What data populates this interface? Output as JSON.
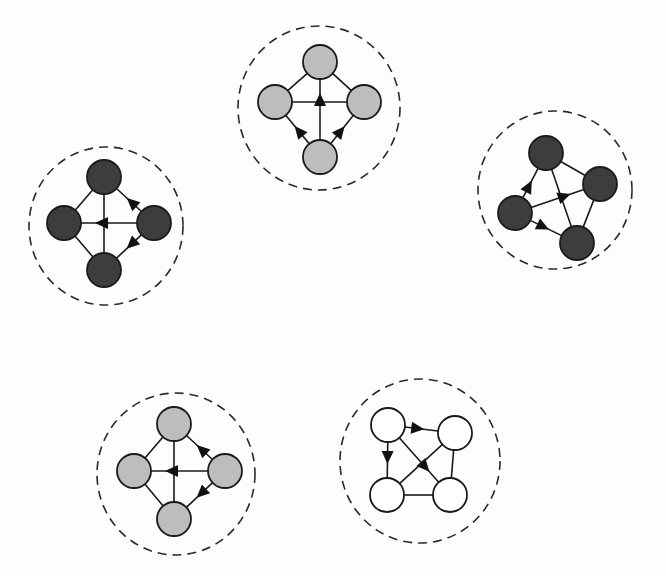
{
  "diagram": {
    "colors": {
      "background": "#fdfdfb",
      "light_gray": "#bdbdbd",
      "dark_gray": "#3d3d3d",
      "white": "#ffffff",
      "stroke": "#1a1a1a"
    },
    "clusters": [
      {
        "id": "top",
        "fill": "#bdbdbd",
        "nodes": [
          "top",
          "left",
          "right",
          "bottom"
        ],
        "edges": [
          {
            "from": "top",
            "to": "left",
            "directed": false
          },
          {
            "from": "top",
            "to": "right",
            "directed": false
          },
          {
            "from": "left",
            "to": "right",
            "directed": false
          },
          {
            "from": "bottom",
            "to": "top",
            "directed": true
          },
          {
            "from": "bottom",
            "to": "left",
            "directed": true
          },
          {
            "from": "bottom",
            "to": "right",
            "directed": true
          }
        ]
      },
      {
        "id": "left",
        "fill": "#3d3d3d",
        "nodes": [
          "top",
          "left",
          "right",
          "bottom"
        ],
        "edges": [
          {
            "from": "top",
            "to": "left",
            "directed": false
          },
          {
            "from": "left",
            "to": "bottom",
            "directed": false
          },
          {
            "from": "top",
            "to": "bottom",
            "directed": false
          },
          {
            "from": "right",
            "to": "left",
            "directed": true
          },
          {
            "from": "right",
            "to": "top",
            "directed": true
          },
          {
            "from": "right",
            "to": "bottom",
            "directed": true
          }
        ]
      },
      {
        "id": "right",
        "fill": "#3d3d3d",
        "nodes": [
          "top",
          "right",
          "left",
          "bottom"
        ],
        "edges": [
          {
            "from": "top",
            "to": "right",
            "directed": false
          },
          {
            "from": "top",
            "to": "bottom",
            "directed": false
          },
          {
            "from": "right",
            "to": "bottom",
            "directed": false
          },
          {
            "from": "left",
            "to": "top",
            "directed": true
          },
          {
            "from": "left",
            "to": "right",
            "directed": true
          },
          {
            "from": "left",
            "to": "bottom",
            "directed": true
          }
        ]
      },
      {
        "id": "bottom-left",
        "fill": "#bdbdbd",
        "nodes": [
          "top",
          "left",
          "right",
          "bottom"
        ],
        "edges": [
          {
            "from": "top",
            "to": "left",
            "directed": false
          },
          {
            "from": "left",
            "to": "bottom",
            "directed": false
          },
          {
            "from": "top",
            "to": "bottom",
            "directed": false
          },
          {
            "from": "right",
            "to": "left",
            "directed": true
          },
          {
            "from": "right",
            "to": "top",
            "directed": true
          },
          {
            "from": "right",
            "to": "bottom",
            "directed": true
          }
        ]
      },
      {
        "id": "bottom-right",
        "fill": "#ffffff",
        "nodes": [
          "tl",
          "tr",
          "bl",
          "br"
        ],
        "edges": [
          {
            "from": "tl",
            "to": "tr",
            "directed": true
          },
          {
            "from": "tl",
            "to": "bl",
            "directed": true
          },
          {
            "from": "tl",
            "to": "br",
            "directed": true
          },
          {
            "from": "tr",
            "to": "bl",
            "directed": false
          },
          {
            "from": "bl",
            "to": "br",
            "directed": false
          },
          {
            "from": "tr",
            "to": "br",
            "directed": false
          }
        ]
      }
    ]
  }
}
